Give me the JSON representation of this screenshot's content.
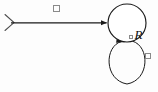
{
  "figure": {
    "type": "state-transition-diagram",
    "background_color": "#fdfdfd",
    "stroke_color": "#1a1a1a",
    "tofu_color": "#8a8a8a",
    "width": 158,
    "height": 92
  },
  "state": {
    "name": "R",
    "label_text": "R",
    "label_prefix_glyph": "missing-glyph-box",
    "shape": "circle",
    "center_x": 127,
    "center_y": 23,
    "radius": 19
  },
  "edges": [
    {
      "id": "initial-arrow",
      "kind": "initial-state-arrow",
      "from": "start",
      "to": "R",
      "tail_marker": "chevron",
      "head_marker": "filled-triangle",
      "x1": 12,
      "y1": 23,
      "x2": 108,
      "y2": 23,
      "label_glyph": "missing-glyph-box"
    },
    {
      "id": "self-loop",
      "kind": "self-transition",
      "from": "R",
      "to": "R",
      "head_marker": "filled-triangle",
      "loop_center_x": 127,
      "loop_center_y": 61,
      "loop_rx": 21,
      "loop_ry": 23,
      "label_glyph": "missing-glyph-box"
    }
  ],
  "glyph_boxes": [
    {
      "id": "edge-label-top",
      "x": 53,
      "y": 5,
      "width": 7,
      "height": 7,
      "glyph": "missing-glyph-box"
    },
    {
      "id": "edge-label-right",
      "x": 145,
      "y": 53,
      "width": 6,
      "height": 6,
      "glyph": "missing-glyph-box"
    }
  ]
}
